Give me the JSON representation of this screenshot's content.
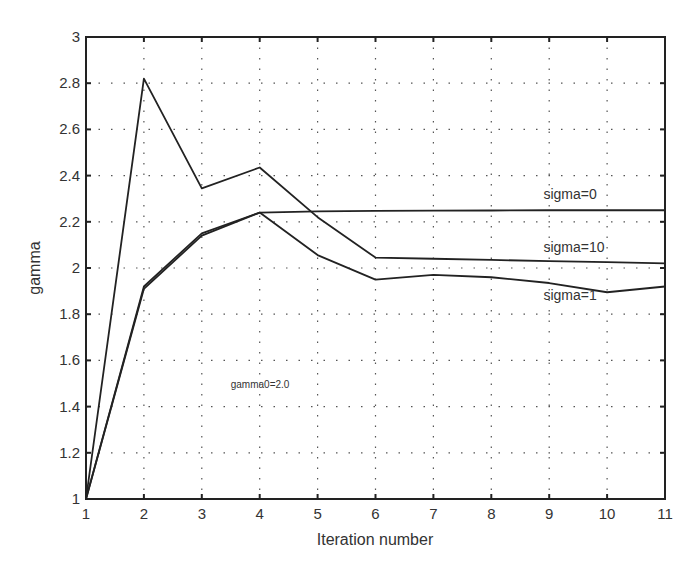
{
  "chart_data": {
    "type": "line",
    "title": "",
    "xlabel": "Iteration number",
    "ylabel": "gamma",
    "x": [
      1,
      2,
      3,
      4,
      5,
      6,
      7,
      8,
      9,
      10,
      11
    ],
    "xlim": [
      1,
      11
    ],
    "ylim": [
      1,
      3
    ],
    "xticks": [
      "1",
      "2",
      "3",
      "4",
      "5",
      "6",
      "7",
      "8",
      "9",
      "10",
      "11"
    ],
    "yticks": [
      "1",
      "1.2",
      "1.4",
      "1.6",
      "1.8",
      "2",
      "2.2",
      "2.4",
      "2.6",
      "2.8",
      "3"
    ],
    "grid": true,
    "legend": "none (inline labels)",
    "series": [
      {
        "name": "sigma=10",
        "values": [
          1.0,
          2.82,
          2.345,
          2.435,
          2.22,
          2.045,
          2.04,
          2.035,
          2.03,
          2.025,
          2.02
        ]
      },
      {
        "name": "sigma=0",
        "values": [
          1.0,
          1.91,
          2.14,
          2.24,
          2.245,
          2.247,
          2.248,
          2.249,
          2.25,
          2.25,
          2.25
        ]
      },
      {
        "name": "sigma=1",
        "values": [
          1.0,
          1.92,
          2.15,
          2.24,
          2.056,
          1.95,
          1.97,
          1.96,
          1.935,
          1.895,
          1.92
        ]
      }
    ],
    "annotations": [
      {
        "text": "sigma=0",
        "x": 8.9,
        "y": 2.3
      },
      {
        "text": "sigma=10",
        "x": 8.9,
        "y": 2.07
      },
      {
        "text": "sigma=1",
        "x": 8.9,
        "y": 1.86
      },
      {
        "text": "gamma0=2.0",
        "x": 3.5,
        "y": 1.48
      }
    ]
  }
}
